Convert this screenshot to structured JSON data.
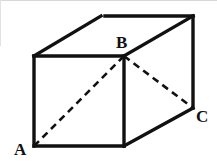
{
  "figure": {
    "name": "labelled-cube-diagram",
    "kind": "geometry-figure",
    "canvas": {
      "width": 217,
      "height": 164
    },
    "background_color": "#ffffff",
    "ink_color": "#111111",
    "scan_edge_color": "#d8d8d8"
  },
  "labels": {
    "a": "A",
    "b": "B",
    "c": "C"
  },
  "label_positions": {
    "a": {
      "x": 14,
      "y": 141
    },
    "b": {
      "x": 116,
      "y": 34
    },
    "c": {
      "x": 196,
      "y": 108
    }
  },
  "vertices": {
    "front_top_left": {
      "x": 34,
      "y": 56
    },
    "front_top_right": {
      "x": 124,
      "y": 56
    },
    "front_bottom_right": {
      "x": 124,
      "y": 146
    },
    "front_bottom_left": {
      "x": 34,
      "y": 146
    },
    "back_top_left": {
      "x": 101,
      "y": 16
    },
    "back_top_right": {
      "x": 193,
      "y": 16
    },
    "back_bottom_right": {
      "x": 193,
      "y": 108
    },
    "back_bottom_left": {
      "x": 101,
      "y": 106
    }
  },
  "vertex_labels_map": {
    "A": "front_bottom_left",
    "B": "front_top_right",
    "C": "back_bottom_right"
  },
  "solid_edges": [
    {
      "name": "front-top-edge",
      "x1": 34,
      "y1": 56,
      "x2": 124,
      "y2": 56
    },
    {
      "name": "front-right-edge",
      "x1": 124,
      "y1": 56,
      "x2": 124,
      "y2": 146
    },
    {
      "name": "front-bottom-edge",
      "x1": 34,
      "y1": 146,
      "x2": 124,
      "y2": 146
    },
    {
      "name": "front-left-edge",
      "x1": 34,
      "y1": 56,
      "x2": 34,
      "y2": 146
    },
    {
      "name": "top-left-receding-edge",
      "x1": 34,
      "y1": 56,
      "x2": 101,
      "y2": 16
    },
    {
      "name": "top-back-edge",
      "x1": 105,
      "y1": 16,
      "x2": 193,
      "y2": 16
    },
    {
      "name": "top-right-receding-edge",
      "x1": 124,
      "y1": 56,
      "x2": 193,
      "y2": 16
    },
    {
      "name": "back-right-vertical-edge",
      "x1": 193,
      "y1": 16,
      "x2": 193,
      "y2": 108
    },
    {
      "name": "bottom-right-receding-edge",
      "x1": 124,
      "y1": 146,
      "x2": 193,
      "y2": 108
    }
  ],
  "dashed_edges": [
    {
      "name": "diagonal-a-to-b",
      "x1": 34,
      "y1": 146,
      "x2": 124,
      "y2": 56
    },
    {
      "name": "diagonal-b-to-c",
      "x1": 124,
      "y1": 56,
      "x2": 193,
      "y2": 108
    }
  ]
}
